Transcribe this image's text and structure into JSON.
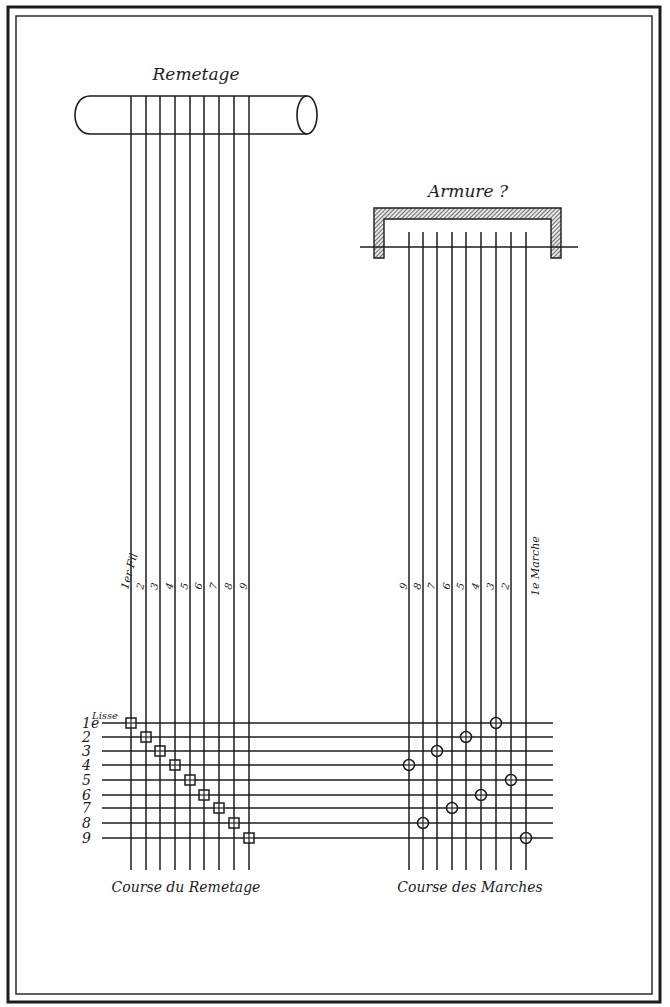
{
  "diagram": {
    "title_remetage": "Remetage",
    "title_armure": "Armure",
    "armure_mark": "?",
    "bottom_left_caption": "Course du Remetage",
    "bottom_right_caption": "Course des Marches",
    "lisse_label": "Lisse",
    "row_labels": [
      "1e",
      "2",
      "3",
      "4",
      "5",
      "6",
      "7",
      "8",
      "9"
    ],
    "remetage_thread_labels": [
      "1er Fil",
      "2",
      "3",
      "4",
      "5",
      "6",
      "7",
      "8",
      "9"
    ],
    "marche_labels": [
      "9",
      "8",
      "7",
      "6",
      "5",
      "4",
      "3",
      "2",
      "1e Marche"
    ],
    "remetage_marks": {
      "shape": "square",
      "row_to_column": [
        1,
        2,
        3,
        4,
        5,
        6,
        7,
        8,
        9
      ]
    },
    "armure_marks": {
      "shape": "circle",
      "row_to_column": [
        7,
        5,
        3,
        1,
        8,
        6,
        4,
        2,
        9
      ]
    },
    "colors": {
      "ink": "#1c1c1c",
      "paper": "#ffffff"
    }
  }
}
